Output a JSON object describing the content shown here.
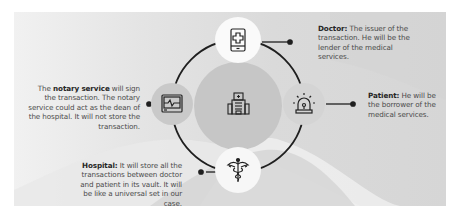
{
  "diagram": {
    "center": {
      "label": "Hospital building",
      "icon": "hospital-building-icon"
    },
    "nodes": [
      {
        "id": "doctor",
        "icon": "mobile-medical-app-icon",
        "position": "top",
        "title": "Doctor:",
        "description": "The issuer of the transaction. He will be the lender of the medical services."
      },
      {
        "id": "patient",
        "icon": "siren-alarm-icon",
        "position": "right",
        "title": "Patient:",
        "description": "He will be the borrower of the medical services."
      },
      {
        "id": "hospital",
        "icon": "caduceus-icon",
        "position": "bottom",
        "title": "Hospital:",
        "description": "It will store all the transactions between doctor and patient in its vault. It will be like a universal set in our case."
      },
      {
        "id": "notary",
        "icon": "heart-monitor-icon",
        "position": "left",
        "prefix": "The ",
        "title": "notary service",
        "description": " will sign the transaction. The notary service could act as the dean of the hospital. It will not store the transaction."
      }
    ]
  },
  "colors": {
    "panel": "#dcdcdc",
    "ring": "#1f1f1f",
    "center_disc": "#c6c6c6",
    "node_white": "#fafafa",
    "node_gray": "#c9c9c9",
    "text": "#4a4a4a",
    "title_text": "#262626"
  }
}
